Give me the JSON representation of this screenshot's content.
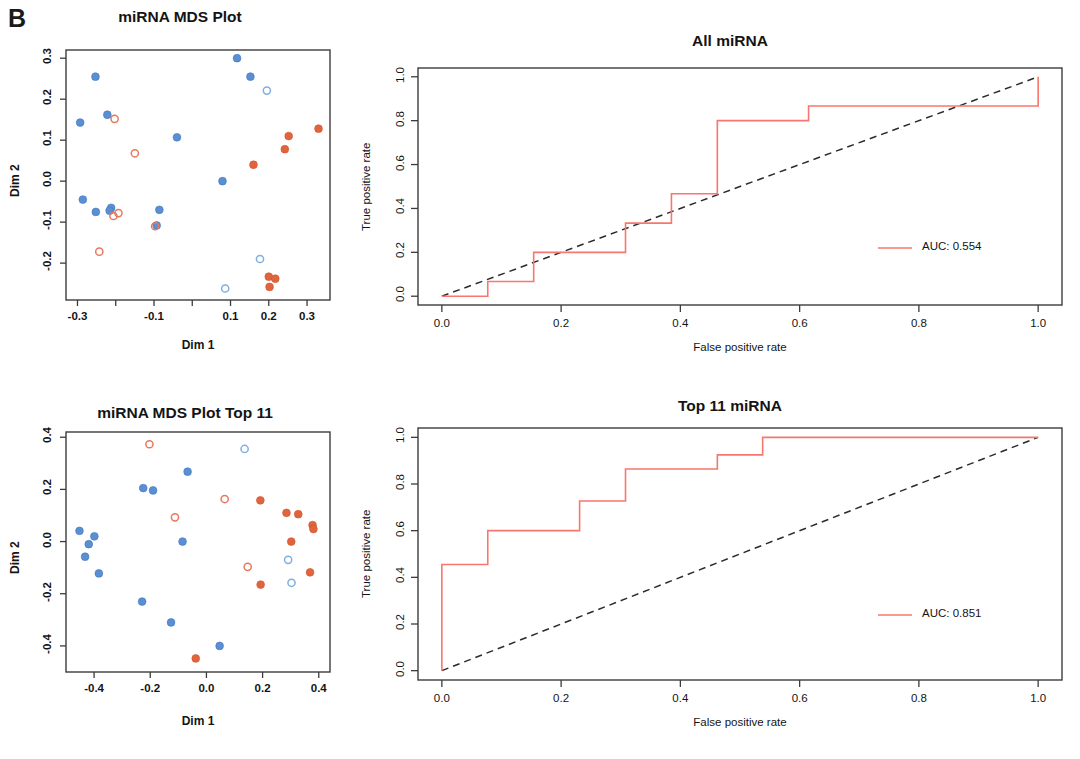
{
  "panel": {
    "label": "B"
  },
  "colors": {
    "group_a_fill": "#5B8FD4",
    "group_a_open": "#7FAEE0",
    "group_b_fill": "#E2643C",
    "group_b_open": "#E8785A",
    "roc_curve": "#F8766D",
    "diagonal": "#2b2b2b"
  },
  "chart_data": [
    {
      "id": "mds_all",
      "type": "scatter",
      "title": "miRNA MDS Plot",
      "xlabel": "Dim 1",
      "ylabel": "Dim 2",
      "xlim": [
        -0.33,
        0.36
      ],
      "ylim": [
        -0.29,
        0.32
      ],
      "xticks": [
        -0.3,
        -0.2,
        -0.1,
        0.0,
        0.1,
        0.2,
        0.3
      ],
      "xticklabels": [
        "-0.3",
        "",
        "-0.1",
        "",
        "0.1",
        "0.2",
        "0.3"
      ],
      "yticks": [
        -0.2,
        -0.1,
        0.0,
        0.1,
        0.2,
        0.3
      ],
      "yticklabels": [
        "-0.2",
        "-0.1",
        "0.0",
        "0.1",
        "0.2",
        "0.3"
      ],
      "grid": false,
      "legend": "none",
      "series": [
        {
          "name": "group-a-filled",
          "marker": "filled-circle",
          "color": "#5B8FD4",
          "points": [
            [
              -0.293,
              0.143
            ],
            [
              -0.253,
              0.255
            ],
            [
              -0.222,
              0.162
            ],
            [
              -0.04,
              0.107
            ],
            [
              0.117,
              0.3
            ],
            [
              0.152,
              0.255
            ],
            [
              -0.286,
              -0.045
            ],
            [
              -0.252,
              -0.075
            ],
            [
              -0.212,
              -0.065
            ],
            [
              -0.216,
              -0.072
            ],
            [
              -0.086,
              -0.07
            ],
            [
              -0.093,
              -0.108
            ],
            [
              0.079,
              0.0
            ]
          ]
        },
        {
          "name": "group-a-open",
          "marker": "open-circle",
          "color": "#7FAEE0",
          "points": [
            [
              0.195,
              0.221
            ],
            [
              0.177,
              -0.19
            ],
            [
              0.086,
              -0.262
            ]
          ]
        },
        {
          "name": "group-b-filled",
          "marker": "filled-circle",
          "color": "#E2643C",
          "points": [
            [
              0.33,
              0.128
            ],
            [
              0.252,
              0.11
            ],
            [
              0.242,
              0.078
            ],
            [
              0.16,
              0.04
            ],
            [
              0.2,
              -0.233
            ],
            [
              0.217,
              -0.238
            ],
            [
              0.202,
              -0.258
            ]
          ]
        },
        {
          "name": "group-b-open",
          "marker": "open-circle",
          "color": "#E8785A",
          "points": [
            [
              -0.203,
              0.152
            ],
            [
              -0.15,
              0.068
            ],
            [
              -0.206,
              -0.085
            ],
            [
              -0.193,
              -0.078
            ],
            [
              -0.097,
              -0.11
            ],
            [
              -0.243,
              -0.172
            ]
          ]
        }
      ]
    },
    {
      "id": "roc_all",
      "type": "line",
      "title": "All miRNA",
      "xlabel": "False positive rate",
      "ylabel": "True positive rate",
      "xlim": [
        -0.04,
        1.04
      ],
      "ylim": [
        -0.04,
        1.04
      ],
      "xticks": [
        0.0,
        0.2,
        0.4,
        0.6,
        0.8,
        1.0
      ],
      "xticklabels": [
        "0.0",
        "0.2",
        "0.4",
        "0.6",
        "0.8",
        "1.0"
      ],
      "yticks": [
        0.0,
        0.2,
        0.4,
        0.6,
        0.8,
        1.0
      ],
      "yticklabels": [
        "0.0",
        "0.2",
        "0.4",
        "0.6",
        "0.8",
        "1.0"
      ],
      "grid": false,
      "legend_position": "bottom-right",
      "legend_label": "AUC: 0.554",
      "auc": 0.554,
      "diagonal_reference": true,
      "roc_points": [
        [
          0.0,
          0.0
        ],
        [
          0.077,
          0.0
        ],
        [
          0.077,
          0.067
        ],
        [
          0.154,
          0.067
        ],
        [
          0.154,
          0.2
        ],
        [
          0.308,
          0.2
        ],
        [
          0.308,
          0.333
        ],
        [
          0.385,
          0.333
        ],
        [
          0.385,
          0.467
        ],
        [
          0.462,
          0.467
        ],
        [
          0.462,
          0.8
        ],
        [
          0.615,
          0.8
        ],
        [
          0.615,
          0.867
        ],
        [
          1.0,
          0.867
        ],
        [
          1.0,
          1.0
        ]
      ]
    },
    {
      "id": "mds_top11",
      "type": "scatter",
      "title": "miRNA MDS Plot Top  11",
      "xlabel": "Dim 1",
      "ylabel": "Dim 2",
      "xlim": [
        -0.5,
        0.44
      ],
      "ylim": [
        -0.5,
        0.42
      ],
      "xticks": [
        -0.4,
        -0.2,
        0.0,
        0.2,
        0.4
      ],
      "xticklabels": [
        "-0.4",
        "-0.2",
        "0.0",
        "0.2",
        "0.4"
      ],
      "yticks": [
        -0.4,
        -0.2,
        0.0,
        0.2,
        0.4
      ],
      "yticklabels": [
        "-0.4",
        "-0.2",
        "0.0",
        "0.2",
        "0.4"
      ],
      "grid": false,
      "legend": "none",
      "series": [
        {
          "name": "group-a-filled",
          "marker": "filled-circle",
          "color": "#5B8FD4",
          "points": [
            [
              -0.452,
              0.041
            ],
            [
              -0.432,
              -0.058
            ],
            [
              -0.419,
              -0.01
            ],
            [
              -0.399,
              0.02
            ],
            [
              -0.383,
              -0.122
            ],
            [
              -0.225,
              0.205
            ],
            [
              -0.19,
              0.196
            ],
            [
              -0.067,
              0.268
            ],
            [
              -0.085,
              0.0
            ],
            [
              -0.229,
              -0.23
            ],
            [
              -0.126,
              -0.31
            ],
            [
              0.047,
              -0.4
            ]
          ]
        },
        {
          "name": "group-a-open",
          "marker": "open-circle",
          "color": "#7FAEE0",
          "points": [
            [
              0.136,
              0.355
            ],
            [
              0.291,
              -0.07
            ],
            [
              0.303,
              -0.158
            ]
          ]
        },
        {
          "name": "group-b-filled",
          "marker": "filled-circle",
          "color": "#E2643C",
          "points": [
            [
              0.192,
              0.158
            ],
            [
              0.285,
              0.11
            ],
            [
              0.327,
              0.105
            ],
            [
              0.378,
              0.063
            ],
            [
              0.381,
              0.048
            ],
            [
              0.302,
              0.0
            ],
            [
              0.369,
              -0.118
            ],
            [
              0.193,
              -0.165
            ],
            [
              -0.038,
              -0.448
            ]
          ]
        },
        {
          "name": "group-b-open",
          "marker": "open-circle",
          "color": "#E8785A",
          "points": [
            [
              -0.203,
              0.373
            ],
            [
              -0.112,
              0.093
            ],
            [
              0.065,
              0.163
            ],
            [
              0.147,
              -0.097
            ]
          ]
        }
      ]
    },
    {
      "id": "roc_top11",
      "type": "line",
      "title": "Top 11 miRNA",
      "xlabel": "False positive rate",
      "ylabel": "True positive rate",
      "xlim": [
        -0.04,
        1.04
      ],
      "ylim": [
        -0.04,
        1.04
      ],
      "xticks": [
        0.0,
        0.2,
        0.4,
        0.6,
        0.8,
        1.0
      ],
      "xticklabels": [
        "0.0",
        "0.2",
        "0.4",
        "0.6",
        "0.8",
        "1.0"
      ],
      "yticks": [
        0.0,
        0.2,
        0.4,
        0.6,
        0.8,
        1.0
      ],
      "yticklabels": [
        "0.0",
        "0.2",
        "0.4",
        "0.6",
        "0.8",
        "1.0"
      ],
      "grid": false,
      "legend_position": "bottom-right",
      "legend_label": "AUC: 0.851",
      "auc": 0.851,
      "diagonal_reference": true,
      "roc_points": [
        [
          0.0,
          0.0
        ],
        [
          0.0,
          0.455
        ],
        [
          0.077,
          0.455
        ],
        [
          0.077,
          0.6
        ],
        [
          0.231,
          0.6
        ],
        [
          0.231,
          0.727
        ],
        [
          0.308,
          0.727
        ],
        [
          0.308,
          0.864
        ],
        [
          0.462,
          0.864
        ],
        [
          0.462,
          0.925
        ],
        [
          0.538,
          0.925
        ],
        [
          0.538,
          1.0
        ],
        [
          1.0,
          1.0
        ]
      ]
    }
  ]
}
